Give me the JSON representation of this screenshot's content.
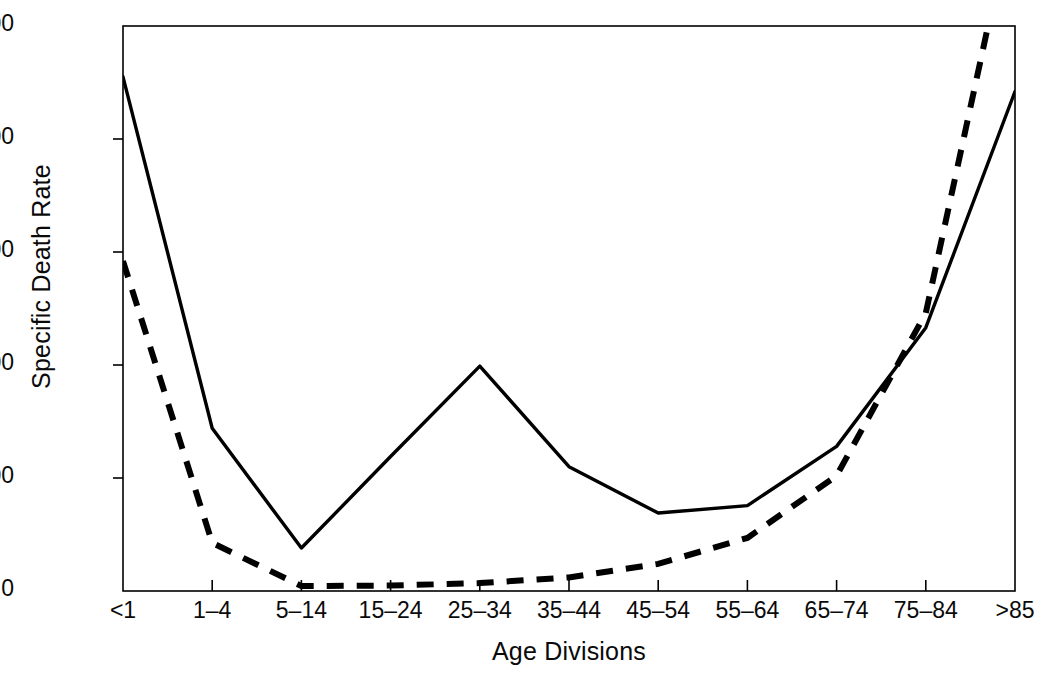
{
  "chart_data": {
    "type": "line",
    "title": "",
    "xlabel": "Age Divisions",
    "ylabel": "Specific Death Rate",
    "categories": [
      "<1",
      "1–4",
      "5–14",
      "15–24",
      "25–34",
      "35–44",
      "45–54",
      "55–64",
      "65–74",
      "75–84",
      ">85"
    ],
    "ylim": [
      0,
      2500
    ],
    "yticks": [
      0,
      500,
      1000,
      1500,
      2000,
      2500
    ],
    "ytick_labels": [
      "0",
      "500",
      "1000",
      "1500",
      "2000",
      "2500"
    ],
    "grid": false,
    "legend": "none",
    "series": [
      {
        "name": "solid-series",
        "style": "solid",
        "color": "#000000",
        "values": [
          2275,
          720,
          190,
          595,
          995,
          550,
          345,
          378,
          640,
          1165,
          2210
        ]
      },
      {
        "name": "dashed-series",
        "style": "dashed",
        "color": "#000000",
        "values": [
          1460,
          213,
          22,
          24,
          35,
          60,
          120,
          235,
          510,
          1230,
          3050
        ],
        "note": "clipped at top of axis between 75–84 and >85"
      }
    ]
  },
  "axis": {
    "y_title": "Specific Death Rate",
    "x_title": "Age Divisions"
  },
  "caption": {
    "text": ""
  }
}
